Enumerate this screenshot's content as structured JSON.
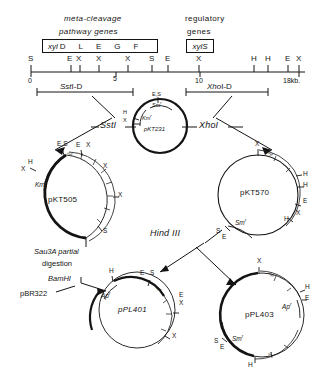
{
  "figure": {
    "title_left": "meta-cleavage",
    "title_left2": "pathway genes",
    "title_right": "regulatory",
    "title_right2": "genes",
    "gene_box_left": {
      "prefix": "xyl",
      "genes": [
        "D",
        "L",
        "E",
        "G",
        "F"
      ]
    },
    "gene_box_right": {
      "label": "xylS"
    }
  },
  "restriction_map": {
    "sites_top": [
      "S",
      "E",
      "X",
      "X",
      "X",
      "S",
      "E",
      "X",
      "H",
      "H",
      "E",
      "X"
    ],
    "scale_labels": [
      "0",
      "5",
      "10",
      "18kb."
    ],
    "fragments": [
      {
        "name": "SstI-D",
        "italic_part": "Sst",
        "plain_part": "I-D"
      },
      {
        "name": "XhoI-D",
        "italic_part": "Xho",
        "plain_part": "I-D"
      }
    ]
  },
  "enzymes": {
    "sst1": "SstI",
    "xho1": "XhoI",
    "hind3": "Hind III",
    "sau3a_line1": "Sau3A partial",
    "sau3a_line2": "digestion",
    "bamh1": "BamHI"
  },
  "plasmids": [
    {
      "id": "pKT231",
      "name": "pKT231",
      "sites": [
        "E,S",
        "H",
        "X"
      ],
      "markers": [
        "Sm",
        "Km"
      ]
    },
    {
      "id": "pKT505",
      "name": "pKT505",
      "sites": [
        "E,S",
        "E",
        "X",
        "X",
        "X",
        "X",
        "H",
        "S"
      ],
      "markers": [
        "Km"
      ],
      "gene_arc": [
        "xyl",
        "D",
        "L",
        "E",
        "G",
        "F"
      ]
    },
    {
      "id": "pKT570",
      "name": "pKT570",
      "sites": [
        "X",
        "H",
        "H",
        "E",
        "X",
        "H",
        "S",
        "E"
      ],
      "markers": [
        "Sm"
      ],
      "gene_arc": [
        "xyl",
        "S"
      ]
    },
    {
      "id": "pPL401",
      "name": "pPL401",
      "sites": [
        "H",
        "E",
        "S",
        "E",
        "X",
        "X"
      ],
      "markers": [
        "Ap"
      ],
      "gene_arc": [
        "xyl",
        "D"
      ]
    },
    {
      "id": "pPL403",
      "name": "pPL403",
      "sites": [
        "X",
        "H",
        "E",
        "S",
        "E",
        "H"
      ],
      "markers": [
        "Ap",
        "Sm"
      ],
      "gene_arc_top": [
        "xyl",
        "S"
      ],
      "gene_arc_bottom": [
        "x2",
        "D"
      ]
    },
    {
      "id": "pBR322",
      "name": "pBR322"
    }
  ],
  "superscripts": {
    "resistance": "r"
  }
}
